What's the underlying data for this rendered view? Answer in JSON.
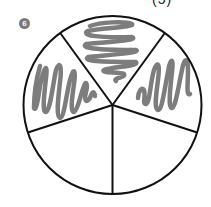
{
  "header": {
    "partial_label": "(5)",
    "problem_number": "6"
  },
  "diagram": {
    "type": "fraction-circle",
    "total_parts": 5,
    "shaded_parts": 3,
    "fraction_shaded": "3/5",
    "shading_style": "scribble",
    "colors": {
      "outline": "#111111",
      "scribble": "#7d7d7d",
      "background": "#ffffff"
    },
    "slices": [
      {
        "position": "top",
        "shaded": true
      },
      {
        "position": "upper-right",
        "shaded": true
      },
      {
        "position": "lower-right",
        "shaded": false
      },
      {
        "position": "lower-left",
        "shaded": false
      },
      {
        "position": "upper-left",
        "shaded": true
      }
    ]
  }
}
